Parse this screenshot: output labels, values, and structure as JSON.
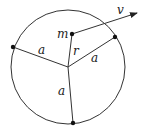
{
  "diagram": {
    "labels": {
      "mass": "m",
      "velocity": "v",
      "distance": "r",
      "radius_left": "a",
      "radius_right": "a",
      "radius_bottom": "a"
    },
    "colors": {
      "stroke": "#333333",
      "dot": "#111111",
      "background": "#ffffff"
    }
  }
}
